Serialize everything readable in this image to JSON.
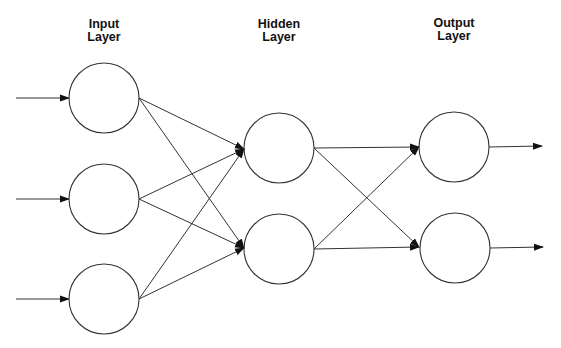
{
  "diagram": {
    "type": "feedforward-neural-network",
    "colors": {
      "stroke": "#333333",
      "background": "#ffffff",
      "text": "#111111"
    },
    "layers": [
      {
        "id": "input",
        "label_line1": "Input",
        "label_line2": "Layer",
        "label_x": 104,
        "label_y": 18
      },
      {
        "id": "hidden",
        "label_line1": "Hidden",
        "label_line2": "Layer",
        "label_x": 279,
        "label_y": 18
      },
      {
        "id": "output",
        "label_line1": "Output",
        "label_line2": "Layer",
        "label_x": 454,
        "label_y": 17
      }
    ],
    "nodes": [
      {
        "id": "i1",
        "layer": "input",
        "cx": 104,
        "cy": 98,
        "r": 35
      },
      {
        "id": "i2",
        "layer": "input",
        "cx": 104,
        "cy": 199,
        "r": 35
      },
      {
        "id": "i3",
        "layer": "input",
        "cx": 104,
        "cy": 299,
        "r": 35
      },
      {
        "id": "h1",
        "layer": "hidden",
        "cx": 279,
        "cy": 148,
        "r": 35
      },
      {
        "id": "h2",
        "layer": "hidden",
        "cx": 279,
        "cy": 249,
        "r": 35
      },
      {
        "id": "o1",
        "layer": "output",
        "cx": 454,
        "cy": 147,
        "r": 35
      },
      {
        "id": "o2",
        "layer": "output",
        "cx": 455,
        "cy": 248,
        "r": 35
      }
    ],
    "input_arrows": [
      {
        "to": "i1",
        "x1": 16,
        "y1": 98,
        "x2": 69,
        "y2": 98
      },
      {
        "to": "i2",
        "x1": 16,
        "y1": 199,
        "x2": 69,
        "y2": 199
      },
      {
        "to": "i3",
        "x1": 16,
        "y1": 299,
        "x2": 69,
        "y2": 299
      }
    ],
    "connections": [
      {
        "from": "i1",
        "to": "h1",
        "x1": 139,
        "y1": 98,
        "x2": 244,
        "y2": 149
      },
      {
        "from": "i1",
        "to": "h2",
        "x1": 139,
        "y1": 98,
        "x2": 244,
        "y2": 248
      },
      {
        "from": "i2",
        "to": "h1",
        "x1": 139,
        "y1": 199,
        "x2": 244,
        "y2": 149
      },
      {
        "from": "i2",
        "to": "h2",
        "x1": 139,
        "y1": 199,
        "x2": 244,
        "y2": 248
      },
      {
        "from": "i3",
        "to": "h1",
        "x1": 139,
        "y1": 299,
        "x2": 244,
        "y2": 149
      },
      {
        "from": "i3",
        "to": "h2",
        "x1": 139,
        "y1": 299,
        "x2": 244,
        "y2": 248
      },
      {
        "from": "h1",
        "to": "o1",
        "x1": 314,
        "y1": 148,
        "x2": 419,
        "y2": 147
      },
      {
        "from": "h1",
        "to": "o2",
        "x1": 314,
        "y1": 148,
        "x2": 419,
        "y2": 247
      },
      {
        "from": "h2",
        "to": "o1",
        "x1": 314,
        "y1": 249,
        "x2": 419,
        "y2": 147
      },
      {
        "from": "h2",
        "to": "o2",
        "x1": 314,
        "y1": 249,
        "x2": 419,
        "y2": 247
      }
    ],
    "output_arrows": [
      {
        "from": "o1",
        "x1": 489,
        "y1": 147,
        "x2": 542,
        "y2": 146
      },
      {
        "from": "o2",
        "x1": 490,
        "y1": 248,
        "x2": 543,
        "y2": 247
      }
    ]
  }
}
